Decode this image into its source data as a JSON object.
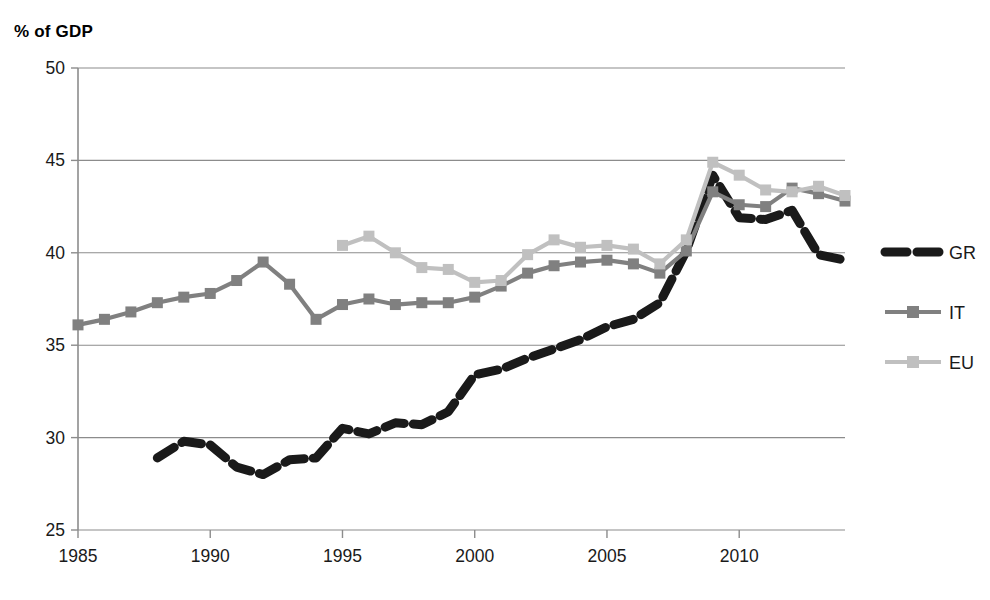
{
  "chart_data": {
    "type": "line",
    "title": "",
    "ylabel": "% of GDP",
    "xlabel": "",
    "xlim": [
      1985,
      2014
    ],
    "ylim": [
      25,
      50
    ],
    "yticks": [
      25,
      30,
      35,
      40,
      45,
      50
    ],
    "ytick_labels": [
      "25",
      "30",
      "35",
      "40",
      "45",
      "50"
    ],
    "xticks": [
      1985,
      1990,
      1995,
      2000,
      2005,
      2010
    ],
    "xtick_labels": [
      "1985",
      "1990",
      "1995",
      "2000",
      "2005",
      "2010"
    ],
    "grid": "horizontal",
    "legend_position": "right",
    "series": [
      {
        "name": "GR",
        "color": "#1a1a1a",
        "style": "dashed-thick",
        "marker": "none",
        "x": [
          1988,
          1989,
          1990,
          1991,
          1992,
          1993,
          1994,
          1995,
          1996,
          1997,
          1998,
          1999,
          2000,
          2001,
          2002,
          2003,
          2004,
          2005,
          2006,
          2007,
          2008,
          2009,
          2010,
          2011,
          2012,
          2013,
          2014
        ],
        "values": [
          28.9,
          29.8,
          29.6,
          28.4,
          28.0,
          28.8,
          28.9,
          30.5,
          30.2,
          30.8,
          30.7,
          31.4,
          33.4,
          33.7,
          34.3,
          34.8,
          35.3,
          36.0,
          36.4,
          37.3,
          40.1,
          44.2,
          41.9,
          41.8,
          42.3,
          39.9,
          39.6
        ]
      },
      {
        "name": "IT",
        "color": "#808080",
        "style": "solid",
        "marker": "square",
        "x": [
          1985,
          1986,
          1987,
          1988,
          1989,
          1990,
          1991,
          1992,
          1993,
          1994,
          1995,
          1996,
          1997,
          1998,
          1999,
          2000,
          2001,
          2002,
          2003,
          2004,
          2005,
          2006,
          2007,
          2008,
          2009,
          2010,
          2011,
          2012,
          2013,
          2014
        ],
        "values": [
          36.1,
          36.4,
          36.8,
          37.3,
          37.6,
          37.8,
          38.5,
          39.5,
          38.3,
          36.4,
          37.2,
          37.5,
          37.2,
          37.3,
          37.3,
          37.6,
          38.2,
          38.9,
          39.3,
          39.5,
          39.6,
          39.4,
          38.9,
          40.1,
          43.3,
          42.6,
          42.5,
          43.5,
          43.2,
          42.8
        ]
      },
      {
        "name": "EU",
        "color": "#c0c0c0",
        "style": "solid",
        "marker": "square",
        "x": [
          1995,
          1996,
          1997,
          1998,
          1999,
          2000,
          2001,
          2002,
          2003,
          2004,
          2005,
          2006,
          2007,
          2008,
          2009,
          2010,
          2011,
          2012,
          2013,
          2014
        ],
        "values": [
          40.4,
          40.9,
          40.0,
          39.2,
          39.1,
          38.4,
          38.5,
          39.9,
          40.7,
          40.3,
          40.4,
          40.2,
          39.4,
          40.7,
          44.9,
          44.2,
          43.4,
          43.3,
          43.6,
          43.1
        ]
      }
    ]
  },
  "legend": {
    "items": [
      {
        "label": "GR"
      },
      {
        "label": "IT"
      },
      {
        "label": "EU"
      }
    ]
  }
}
